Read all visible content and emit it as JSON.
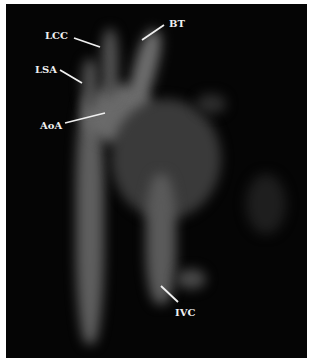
{
  "figure": {
    "labels": [
      {
        "text": "LCC",
        "x": 16,
        "y": 26
      },
      {
        "text": "BT",
        "x": 170,
        "y": 18
      },
      {
        "text": "LSA",
        "x": 8,
        "y": 64
      },
      {
        "text": "AoA",
        "x": 38,
        "y": 116
      },
      {
        "text": "IVC",
        "x": 172,
        "y": 306
      }
    ]
  }
}
